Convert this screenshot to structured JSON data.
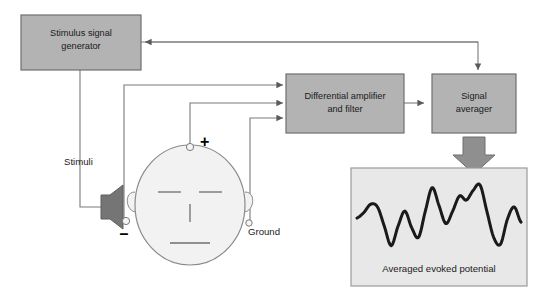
{
  "diagram": {
    "boxes": [
      {
        "id": "stimulus-generator",
        "label_line1": "Stimulus signal",
        "label_line2": "generator"
      },
      {
        "id": "differential-amplifier",
        "label_line1": "Differential amplifier",
        "label_line2": "and filter"
      },
      {
        "id": "signal-averager",
        "label_line1": "Signal",
        "label_line2": "averager"
      }
    ],
    "labels": {
      "stimuli": "Stimuli",
      "ground": "Ground",
      "positive": "+",
      "negative": "–"
    },
    "output_panel": {
      "caption": "Averaged evoked potential"
    },
    "icons": {
      "speaker": "speaker-icon",
      "head": "head-icon",
      "down_arrow": "thick-down-arrow-icon",
      "electrode_positive": "electrode-icon",
      "electrode_negative": "electrode-icon",
      "electrode_ground": "electrode-icon"
    },
    "colors": {
      "box_fill": "#b3b3b3",
      "box_stroke": "#6e6e6e",
      "panel_fill": "#e8e8e8",
      "panel_stroke": "#9a9a9a",
      "wire": "#7a7a7a",
      "speaker_fill": "#757575",
      "head_fill": "#f2f2f2",
      "head_stroke": "#8a8a8a",
      "waveform": "#1a1a1a",
      "text": "#1a1a1a",
      "arrow_fill": "#8f8f8f"
    }
  },
  "chart_data": {
    "type": "line",
    "title": "Averaged evoked potential",
    "xlabel": "",
    "ylabel": "",
    "grid": false,
    "legend": "none",
    "x": [
      0,
      1,
      2,
      3,
      4,
      5,
      6,
      7,
      8,
      9,
      10,
      11,
      12,
      13,
      14,
      15,
      16,
      17,
      18,
      19,
      20,
      21,
      22,
      23,
      24
    ],
    "values": [
      0.42,
      0.5,
      0.62,
      0.58,
      0.3,
      0.02,
      0.3,
      0.52,
      0.28,
      0.14,
      0.52,
      0.86,
      0.6,
      0.34,
      0.52,
      0.74,
      0.68,
      0.82,
      0.9,
      0.52,
      0.14,
      0.04,
      0.4,
      0.58,
      0.36
    ]
  }
}
